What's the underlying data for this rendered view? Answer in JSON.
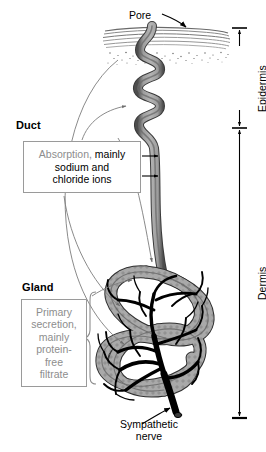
{
  "figure": {
    "background_color": "#ffffff",
    "duct_color": "#8a8a8a",
    "nerve_color": "#000000",
    "callout_text_gray": "#8d8d8d",
    "callout_border": "#9a9a9a",
    "leader_line_color": "#7d7d7d"
  },
  "labels": {
    "pore": "Pore",
    "duct": "Duct",
    "gland": "Gland",
    "sympathetic_nerve": "Sympathetic\nnerve",
    "sympathetic_nerve_line1": "Sympathetic",
    "sympathetic_nerve_line2": "nerve"
  },
  "callouts": {
    "absorption": {
      "lead_word": "Absorption,",
      "rest_line1": " mainly",
      "line2": "sodium and",
      "line3": "chloride ions",
      "full_text": "Absorption, mainly sodium and chloride ions",
      "arrow_count": 2
    },
    "secretion": {
      "line1": "Primary",
      "line2": "secretion,",
      "line3": "mainly",
      "line4": "protein-",
      "line5": "free",
      "line6": "filtrate",
      "full_text": "Primary secretion, mainly protein-free filtrate"
    }
  },
  "scale_bars": {
    "epidermis": {
      "label": "Epidermis",
      "top_y": 28,
      "bottom_y": 128,
      "orientation": "vertical",
      "arrowheads": "both"
    },
    "dermis": {
      "label": "Dermis",
      "top_y": 128,
      "bottom_y": 418,
      "orientation": "vertical",
      "arrowheads": "both"
    }
  },
  "regions": {
    "skin_surface": "stratum corneum striations",
    "stipple": "granular dermal stipple"
  }
}
